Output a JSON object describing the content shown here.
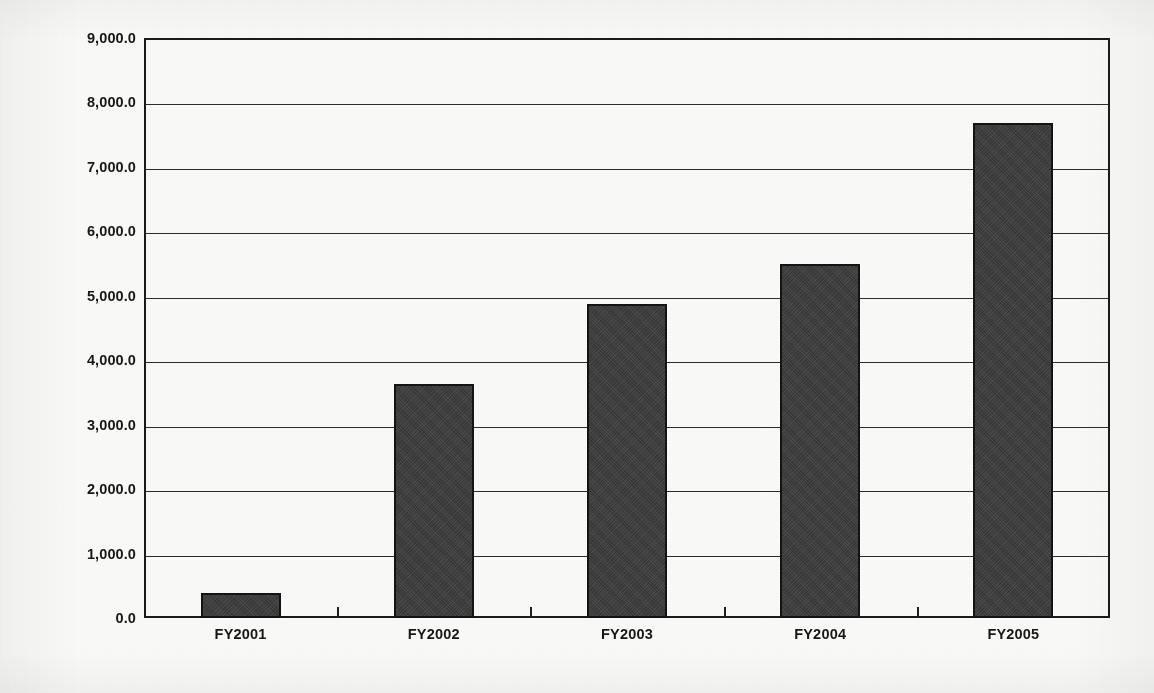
{
  "chart_data": {
    "type": "bar",
    "title": "",
    "subtitle": "",
    "xlabel": "",
    "ylabel": "Amount (in $ millions)",
    "categories": [
      "FY2001",
      "FY2002",
      "FY2003",
      "FY2004",
      "FY2005"
    ],
    "values": [
      390,
      3630,
      4880,
      5500,
      7680
    ],
    "series": [
      {
        "name": "Amount",
        "values": [
          390,
          3630,
          4880,
          5500,
          7680
        ]
      }
    ],
    "ylim": [
      0,
      9000
    ],
    "ytick_values": [
      0,
      1000,
      2000,
      3000,
      4000,
      5000,
      6000,
      7000,
      8000,
      9000
    ],
    "ytick_labels": [
      "0.0",
      "1,000.0",
      "2,000.0",
      "3,000.0",
      "4,000.0",
      "5,000.0",
      "6,000.0",
      "7,000.0",
      "8,000.0",
      "9,000.0"
    ],
    "grid": true,
    "grid_axis": "y",
    "legend": false,
    "legend_position": "none",
    "bar_color": "#3b3b3b",
    "bar_edge_color": "#141414",
    "axis_color": "#1a1a1a",
    "background_color": "#fbfbf9",
    "annotations": []
  },
  "figure": {
    "bleed_through_text": "",
    "plot_background": "#fbfbf9"
  }
}
